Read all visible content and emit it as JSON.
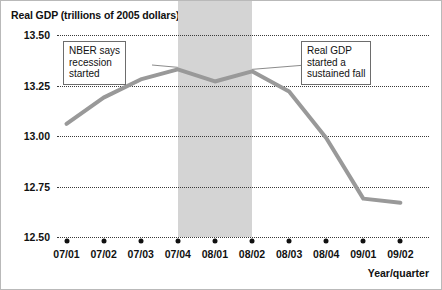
{
  "chart_data": {
    "type": "line",
    "title": "Real GDP (trillions of 2005 dollars)",
    "xlabel": "Year/quarter",
    "ylabel": "",
    "categories": [
      "07/01",
      "07/02",
      "07/03",
      "08/04-placeholder",
      "08/01",
      "08/02",
      "08/03",
      "08/04",
      "09/01",
      "09/02"
    ],
    "x": [
      "07/01",
      "07/02",
      "07/03",
      "07/04",
      "08/01",
      "08/02",
      "08/03",
      "08/04",
      "09/01",
      "09/02"
    ],
    "values": [
      13.06,
      13.19,
      13.28,
      13.33,
      13.27,
      13.32,
      13.22,
      12.99,
      12.69,
      12.67
    ],
    "series": [
      {
        "name": "Real GDP",
        "values": [
          13.06,
          13.19,
          13.28,
          13.33,
          13.27,
          13.32,
          13.22,
          12.99,
          12.69,
          12.67
        ]
      }
    ],
    "ylim": [
      12.5,
      13.5
    ],
    "yticks": [
      13.5,
      13.25,
      13.0,
      12.75,
      12.5
    ],
    "ytick_labels": [
      "13.50",
      "13.25",
      "13.00",
      "12.75",
      "12.50"
    ],
    "grid": true,
    "grid_style": "dotted-horizontal",
    "legend": "none",
    "line_color": "#999999",
    "shaded_region": {
      "label": "recession",
      "from": "07/04",
      "to": "08/02",
      "color": "#d4d4d4"
    },
    "annotations": [
      {
        "name": "nber-recession-note",
        "text": "NBER says\nrecession\nstarted",
        "points_to": "07/04"
      },
      {
        "name": "sustained-fall-note",
        "text": "Real GDP\nstarted a\nsustained fall",
        "points_to": "08/02"
      }
    ]
  }
}
